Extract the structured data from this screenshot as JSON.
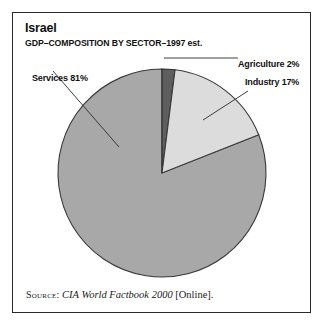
{
  "figure": {
    "title": "Israel",
    "subtitle": "GDP–COMPOSITION BY SECTOR–1997 est.",
    "source": {
      "label": "Source:",
      "title": "CIA World Factbook 2000",
      "suffix": "[Online]."
    },
    "frame_color": "#2b2b2b",
    "background_color": "#ffffff"
  },
  "chart_data": {
    "type": "pie",
    "title": "Israel",
    "subtitle": "GDP–COMPOSITION BY SECTOR–1997 est.",
    "xlabel": "",
    "ylabel": "",
    "legend_position": "none",
    "grid": false,
    "start_angle_deg": -90,
    "direction": "clockwise",
    "unit": "percent",
    "categories": [
      "Agriculture",
      "Industry",
      "Services"
    ],
    "values": [
      2,
      17,
      81
    ],
    "colors": [
      "#5e5e5e",
      "#dcdcdc",
      "#a8a8a8"
    ],
    "labels": [
      {
        "name": "Agriculture",
        "text": "Agriculture 2%",
        "value": 2,
        "color": "#5e5e5e"
      },
      {
        "name": "Industry",
        "text": "Industry 17%",
        "value": 17,
        "color": "#dcdcdc"
      },
      {
        "name": "Services",
        "text": "Services 81%",
        "value": 81,
        "color": "#a8a8a8"
      }
    ],
    "center": {
      "x": 161,
      "y": 172
    },
    "radius": 104
  },
  "labels": {
    "services": "Services 81%",
    "agriculture": "Agriculture 2%",
    "industry": "Industry 17%"
  }
}
